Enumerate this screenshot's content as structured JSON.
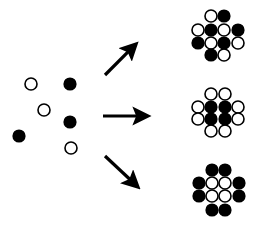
{
  "diagram": {
    "background": "#ffffff",
    "colors": {
      "black": "#000000",
      "white": "#ffffff",
      "stroke": "#000000"
    },
    "particle_radius": 6,
    "scattered_particles": [
      {
        "x": 31,
        "y": 84,
        "fill": "white"
      },
      {
        "x": 70,
        "y": 84,
        "fill": "black"
      },
      {
        "x": 44,
        "y": 110,
        "fill": "white"
      },
      {
        "x": 70,
        "y": 122,
        "fill": "black"
      },
      {
        "x": 19,
        "y": 136,
        "fill": "black"
      },
      {
        "x": 71,
        "y": 148,
        "fill": "white"
      }
    ],
    "arrows": [
      {
        "name": "arrow-up-right",
        "x1": 105,
        "y1": 75,
        "x2": 136,
        "y2": 44
      },
      {
        "name": "arrow-right",
        "x1": 103,
        "y1": 116,
        "x2": 148,
        "y2": 116
      },
      {
        "name": "arrow-down-right",
        "x1": 105,
        "y1": 156,
        "x2": 138,
        "y2": 187
      }
    ],
    "clusters": [
      {
        "name": "cluster-alternating",
        "description": "checkerboard / alternating arrangement",
        "cols": [
          198,
          211,
          224,
          238
        ],
        "rows": [
          16,
          30,
          43,
          55
        ],
        "grid": [
          [
            "",
            "W",
            "B",
            ""
          ],
          [
            "W",
            "B",
            "W",
            "B"
          ],
          [
            "B",
            "W",
            "B",
            "W"
          ],
          [
            "",
            "B",
            "W",
            ""
          ]
        ]
      },
      {
        "name": "cluster-black-core",
        "description": "black core, white shell",
        "cols": [
          198,
          211,
          225,
          238
        ],
        "rows": [
          94,
          107,
          119,
          131
        ],
        "grid": [
          [
            "",
            "W",
            "W",
            ""
          ],
          [
            "W",
            "B",
            "B",
            "W"
          ],
          [
            "W",
            "B",
            "B",
            "W"
          ],
          [
            "",
            "W",
            "W",
            ""
          ]
        ]
      },
      {
        "name": "cluster-white-core",
        "description": "white core, black shell",
        "cols": [
          199,
          212,
          225,
          239
        ],
        "rows": [
          170,
          183,
          196,
          210
        ],
        "grid": [
          [
            "",
            "B",
            "B",
            ""
          ],
          [
            "B",
            "W",
            "W",
            "B"
          ],
          [
            "B",
            "W",
            "W",
            "B"
          ],
          [
            "",
            "B",
            "B",
            ""
          ]
        ]
      }
    ]
  }
}
